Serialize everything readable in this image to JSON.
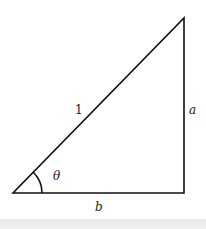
{
  "diagram": {
    "type": "right-triangle",
    "colors": {
      "stroke": "#111111",
      "background": "#ffffff",
      "strip": "#ebebeb"
    },
    "vertices": {
      "origin": [
        13,
        193
      ],
      "right_angle": [
        184,
        193
      ],
      "top": [
        184,
        18
      ]
    },
    "labels": {
      "hypotenuse": "1",
      "vertical_side": "a",
      "horizontal_side": "b",
      "angle": "θ"
    }
  }
}
